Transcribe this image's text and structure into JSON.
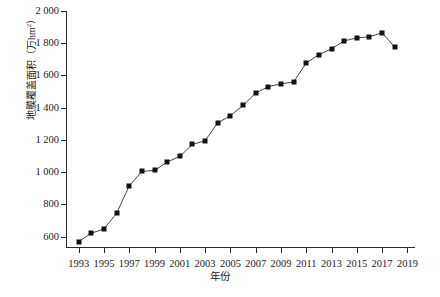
{
  "chart_data": {
    "type": "line",
    "title": "",
    "xlabel": "年份",
    "ylabel": "地膜覆盖面积（万hm²）",
    "ylabel_main": "地膜覆盖面积（万hm",
    "ylabel_sup": "2",
    "ylabel_tail": "）",
    "xlim": [
      1992,
      2019.6
    ],
    "ylim": [
      530,
      2000
    ],
    "grid": false,
    "legend": null,
    "marker": "filled-square",
    "marker_color": "#111111",
    "line_color": "#444444",
    "x": [
      1993,
      1994,
      1995,
      1996,
      1997,
      1998,
      1999,
      2000,
      2001,
      2002,
      2003,
      2004,
      2005,
      2006,
      2007,
      2008,
      2009,
      2010,
      2011,
      2012,
      2013,
      2014,
      2015,
      2016,
      2017,
      2018
    ],
    "values": [
      570,
      622,
      648,
      745,
      915,
      1005,
      1011,
      1063,
      1098,
      1172,
      1196,
      1306,
      1351,
      1414,
      1491,
      1531,
      1548,
      1560,
      1678,
      1729,
      1765,
      1815,
      1833,
      1840,
      1865,
      1775
    ],
    "x_ticks": [
      1993,
      1995,
      1997,
      1999,
      2001,
      2003,
      2005,
      2007,
      2009,
      2011,
      2013,
      2015,
      2017,
      2019
    ],
    "x_tick_labels": [
      "1993",
      "1995",
      "1997",
      "1999",
      "2001",
      "2003",
      "2005",
      "2007",
      "2009",
      "2011",
      "2013",
      "2015",
      "2017",
      "2019"
    ],
    "y_ticks": [
      600,
      800,
      1000,
      1200,
      1400,
      1600,
      1800,
      2000
    ],
    "y_tick_labels": [
      "600",
      "800",
      "1 000",
      "1 200",
      "1 400",
      "1 600",
      "1 800",
      "2 000"
    ]
  },
  "figure": {
    "caption_partial": ""
  }
}
